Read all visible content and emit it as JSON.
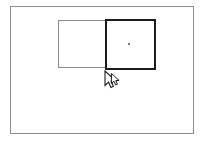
{
  "canvas": {
    "width": 205,
    "height": 141,
    "background_color": "#ffffff",
    "label": "drawing-canvas"
  },
  "artboard": {
    "label": "artboard",
    "x": 10,
    "y": 6,
    "width": 184,
    "height": 128,
    "border_color": "#8d8d8d",
    "border_width": 1,
    "fill_color": "#ffffff"
  },
  "shapes": [
    {
      "id": "rect-left",
      "label": "rectangle-unselected",
      "x": 58,
      "y": 20,
      "width": 48,
      "height": 48,
      "border_color": "#8b8b8b",
      "border_width": 1,
      "fill": "none",
      "selected": false
    },
    {
      "id": "rect-right",
      "label": "rectangle-selected",
      "x": 105,
      "y": 19,
      "width": 51,
      "height": 51,
      "border_color": "#1b1b1b",
      "border_width": 2,
      "fill": "none",
      "selected": true,
      "center_marker": {
        "label": "center-point",
        "x": 129,
        "y": 44,
        "color": "#4a4a4a"
      }
    }
  ],
  "cursor": {
    "label": "drag-cursor",
    "type": "arrow-drag",
    "x": 104,
    "y": 70,
    "fill_color": "#ffffff",
    "stroke_color": "#1b1b1b"
  }
}
